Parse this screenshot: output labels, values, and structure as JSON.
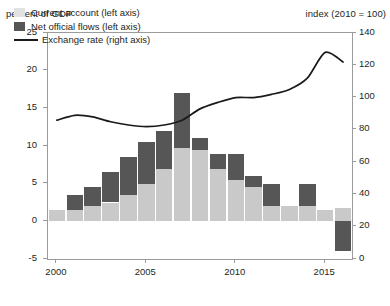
{
  "left_axis_title": "percent of GDP",
  "right_axis_title": "index (2010 = 100)",
  "legend": [
    {
      "label": "Current account (left axis)",
      "marker": "swatch-current-account",
      "color": "#e2e2e2"
    },
    {
      "label": "Net official flows (left axis)",
      "marker": "swatch-net-official-flows",
      "color": "#565656"
    },
    {
      "label": "Exchange rate (right axis)",
      "marker": "swatch-exchange-rate-line",
      "color": "#1a1a1a"
    }
  ],
  "chart_data": {
    "type": "bar",
    "title": "",
    "subtitle": "",
    "xlabel": "",
    "ylabel": "percent of GDP",
    "y2label": "index (2010 = 100)",
    "ylim": [
      -5,
      25
    ],
    "y2lim": [
      0,
      140
    ],
    "xlim": [
      1999.5,
      2016.5
    ],
    "grid": false,
    "legend_position": "top-left",
    "stacked": true,
    "yticks": [
      -5,
      0,
      5,
      10,
      15,
      20,
      25
    ],
    "ytick_labels": [
      "-5",
      "0",
      "5",
      "10",
      "15",
      "20",
      "25"
    ],
    "y2ticks": [
      0,
      20,
      40,
      60,
      80,
      100,
      120,
      140
    ],
    "y2tick_labels": [
      "0",
      "20",
      "40",
      "60",
      "80",
      "100",
      "120",
      "140"
    ],
    "xticks": [
      2000,
      2005,
      2010,
      2015
    ],
    "xtick_labels": [
      "2000",
      "2005",
      "2010",
      "2015"
    ],
    "categories": [
      2000,
      2001,
      2002,
      2003,
      2004,
      2005,
      2006,
      2007,
      2008,
      2009,
      2010,
      2011,
      2012,
      2013,
      2014,
      2015,
      2016
    ],
    "series": [
      {
        "name": "Current account (left axis)",
        "axis": "left",
        "type": "bar",
        "color": "#c9c9c9",
        "values": [
          1.5,
          1.5,
          2.0,
          2.5,
          3.5,
          5.0,
          7.0,
          9.8,
          9.5,
          7.0,
          5.5,
          4.5,
          2.0,
          2.0,
          2.0,
          1.5,
          1.8
        ]
      },
      {
        "name": "Net official flows (left axis)",
        "axis": "left",
        "type": "bar",
        "color": "#565656",
        "values": [
          0.0,
          2.0,
          2.5,
          4.0,
          5.0,
          5.5,
          5.0,
          7.2,
          1.5,
          2.0,
          3.5,
          1.5,
          3.0,
          0.0,
          3.0,
          0.0,
          -4.0
        ]
      },
      {
        "name": "Exchange rate (right axis)",
        "axis": "right",
        "type": "line",
        "color": "#1a1a1a",
        "values": [
          86,
          89,
          88,
          85,
          83,
          82,
          83,
          86,
          93,
          97,
          100,
          100,
          102,
          105,
          112,
          128,
          122
        ]
      }
    ]
  }
}
